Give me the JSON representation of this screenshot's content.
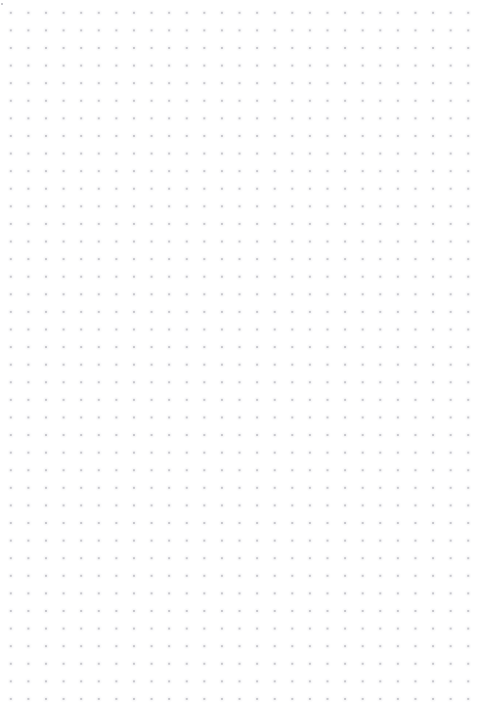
{
  "canvas": {
    "label": "",
    "background_color": "#ffffff",
    "dot_color": "#c9c9ce",
    "dot_halo_color": "#bebec6",
    "origin_dot_color": "#b4b4bb",
    "dot_diameter_px": 1.2,
    "grid_pitch_px": 17.6,
    "grid_offset_x_px": 2,
    "grid_offset_y_px": 4,
    "columns": 28,
    "rows": 41,
    "width_px": 480,
    "height_px": 713,
    "content": ""
  }
}
